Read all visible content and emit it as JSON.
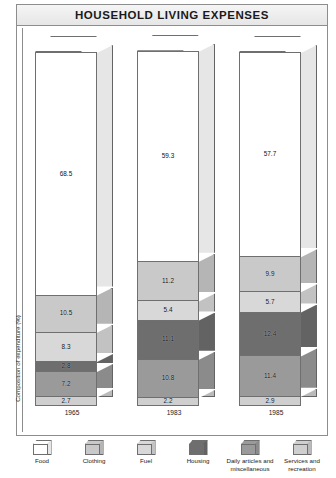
{
  "header": {
    "title": "HOUSEHOLD LIVING EXPENSES"
  },
  "axis": {
    "ylabel": "Composition of expenditure (%)"
  },
  "legend": {
    "items": [
      {
        "label": "Food",
        "color": "#ffffff"
      },
      {
        "label": "Clothing",
        "color": "#c9c9c9"
      },
      {
        "label": "Fuel",
        "color": "#d8d8d8"
      },
      {
        "label": "Housing",
        "color": "#6e6e6e"
      },
      {
        "label": "Daily articles and miscellaneous",
        "color": "#9a9a9a"
      },
      {
        "label": "Services and recreation",
        "color": "#cfcfcf"
      }
    ]
  },
  "chart_data": {
    "type": "bar",
    "title": "HOUSEHOLD LIVING EXPENSES",
    "xlabel": "",
    "ylabel": "Composition of expenditure (%)",
    "ylim": [
      0,
      100
    ],
    "grid": false,
    "stacked": true,
    "legend_position": "bottom",
    "categories": [
      "1965",
      "1983",
      "1985"
    ],
    "series": [
      {
        "name": "Food",
        "color": "#ffffff",
        "values": [
          68.5,
          59.3,
          57.7
        ]
      },
      {
        "name": "Clothing",
        "color": "#c9c9c9",
        "values": [
          10.5,
          11.2,
          9.9
        ]
      },
      {
        "name": "Fuel",
        "color": "#d8d8d8",
        "values": [
          8.3,
          5.4,
          5.7
        ]
      },
      {
        "name": "Housing",
        "color": "#6e6e6e",
        "values": [
          2.8,
          11.1,
          12.4
        ]
      },
      {
        "name": "Daily articles and miscellaneous",
        "color": "#9a9a9a",
        "values": [
          7.2,
          10.8,
          11.4
        ]
      },
      {
        "name": "Services and recreation",
        "color": "#cfcfcf",
        "values": [
          2.7,
          2.2,
          2.9
        ]
      }
    ],
    "bars": [
      {
        "year": "1965",
        "segments": [
          {
            "label": "Food",
            "value": "68.5",
            "color": "#ffffff"
          },
          {
            "label": "Clothing",
            "value": "10.5",
            "color": "#c9c9c9"
          },
          {
            "label": "Fuel",
            "value": "8.3",
            "color": "#d8d8d8"
          },
          {
            "label": "Housing",
            "value": "2.8",
            "color": "#6e6e6e"
          },
          {
            "label": "Daily articles and miscellaneous",
            "value": "7.2",
            "color": "#9a9a9a"
          },
          {
            "label": "Services and recreation",
            "value": "2.7",
            "color": "#cfcfcf"
          }
        ]
      },
      {
        "year": "1983",
        "segments": [
          {
            "label": "Food",
            "value": "59.3",
            "color": "#ffffff"
          },
          {
            "label": "Clothing",
            "value": "11.2",
            "color": "#c9c9c9"
          },
          {
            "label": "Fuel",
            "value": "5.4",
            "color": "#d8d8d8"
          },
          {
            "label": "Housing",
            "value": "11.1",
            "color": "#6e6e6e"
          },
          {
            "label": "Daily articles and miscellaneous",
            "value": "10.8",
            "color": "#9a9a9a"
          },
          {
            "label": "Services and recreation",
            "value": "2.2",
            "color": "#cfcfcf"
          }
        ]
      },
      {
        "year": "1985",
        "segments": [
          {
            "label": "Food",
            "value": "57.7",
            "color": "#ffffff"
          },
          {
            "label": "Clothing",
            "value": "9.9",
            "color": "#c9c9c9"
          },
          {
            "label": "Fuel",
            "value": "5.7",
            "color": "#d8d8d8"
          },
          {
            "label": "Housing",
            "value": "12.4",
            "color": "#6e6e6e"
          },
          {
            "label": "Daily articles and miscellaneous",
            "value": "11.4",
            "color": "#9a9a9a"
          },
          {
            "label": "Services and recreation",
            "value": "2.9",
            "color": "#cfcfcf"
          }
        ]
      }
    ]
  }
}
